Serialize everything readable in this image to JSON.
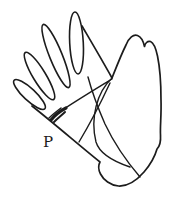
{
  "diagram": {
    "label": "P",
    "ink_color": "#1c1c1c",
    "background_color": "#ffffff"
  }
}
